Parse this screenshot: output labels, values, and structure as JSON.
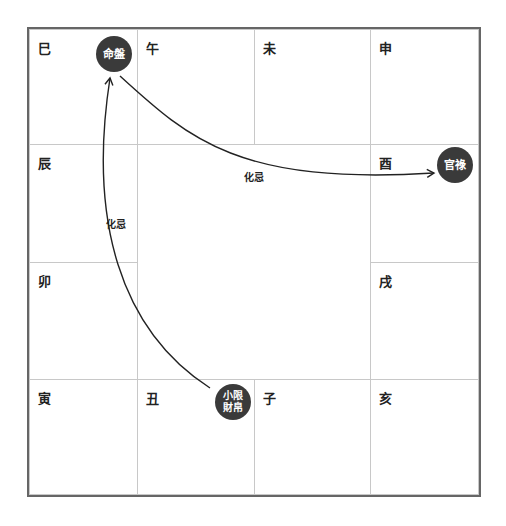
{
  "branches": {
    "si": "巳",
    "wu": "午",
    "wei": "未",
    "shen": "申",
    "chen": "辰",
    "you": "酉",
    "mao": "卯",
    "xu": "戌",
    "yin": "寅",
    "chou": "丑",
    "zi": "子",
    "hai": "亥"
  },
  "badges": {
    "ming_pan": "命盤",
    "guan_lu": "官祿",
    "xiao_xian_line1": "小限",
    "xiao_xian_line2": "財帛"
  },
  "arrows": {
    "left_label": "化忌",
    "top_label": "化忌"
  },
  "colors": {
    "badge_bg": "#3a3a3a",
    "line": "#222222",
    "grid": "#c8c8c8",
    "border": "#666666"
  }
}
